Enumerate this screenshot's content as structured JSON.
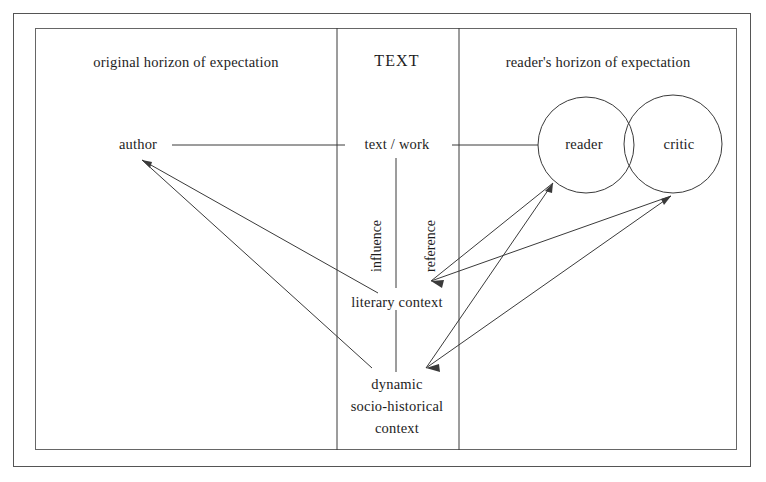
{
  "diagram": {
    "title_center": "TEXT",
    "columns": [
      {
        "id": "left",
        "title": "original horizon of expectation"
      },
      {
        "id": "center",
        "title": "TEXT"
      },
      {
        "id": "right",
        "title": "reader's horizon of expectation"
      }
    ],
    "nodes": [
      {
        "id": "author",
        "label": "author"
      },
      {
        "id": "text-work",
        "label": "text / work"
      },
      {
        "id": "literary-context",
        "label": "literary context"
      },
      {
        "id": "dynamic-context",
        "label": "dynamic\nsocio-historical\ncontext"
      },
      {
        "id": "dynamic-context-line1",
        "label": "dynamic"
      },
      {
        "id": "dynamic-context-line2",
        "label": "socio-historical"
      },
      {
        "id": "dynamic-context-line3",
        "label": "context"
      },
      {
        "id": "reader",
        "label": "reader"
      },
      {
        "id": "critic",
        "label": "critic"
      }
    ],
    "edge_labels": [
      {
        "id": "influence",
        "label": "influence",
        "orientation": "vertical"
      },
      {
        "id": "reference",
        "label": "reference",
        "orientation": "vertical"
      }
    ],
    "colors": {
      "stroke": "#3a3a3a",
      "frame": "#555555",
      "text": "#1d1d1d",
      "background": "#ffffff"
    }
  }
}
